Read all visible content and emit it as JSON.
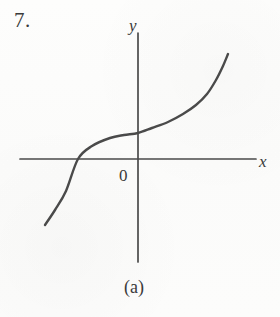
{
  "figure": {
    "problem_number": "7.",
    "caption": "(a)",
    "origin_label": "0",
    "x_axis_label": "x",
    "y_axis_label": "y",
    "background_color": "#fcfcfb",
    "ink_color": "#4a4a4a",
    "text_color": "#3a3a3a"
  },
  "chart_data": {
    "type": "line",
    "title": "",
    "subtitle": "",
    "xlabel": "x",
    "ylabel": "y",
    "legend": [],
    "grid": false,
    "annotations": [
      "0"
    ],
    "axes": {
      "origin_px": [
        138,
        159
      ],
      "x_axis_px": {
        "x_start": 20,
        "x_end": 256,
        "y": 159
      },
      "y_axis_px": {
        "y_start": 33,
        "y_end": 262,
        "x": 138
      },
      "x_arrow": false,
      "y_arrow": false
    },
    "series": [
      {
        "name": "curve",
        "points_px": [
          [
            45,
            225
          ],
          [
            55,
            210
          ],
          [
            66,
            191
          ],
          [
            78,
            159
          ],
          [
            92,
            146
          ],
          [
            110,
            138
          ],
          [
            124,
            135
          ],
          [
            138,
            133
          ],
          [
            152,
            128
          ],
          [
            168,
            122
          ],
          [
            183,
            114
          ],
          [
            196,
            105
          ],
          [
            207,
            94
          ],
          [
            216,
            80
          ],
          [
            223,
            66
          ],
          [
            228,
            54
          ]
        ],
        "x_intercept_px": [
          78,
          159
        ],
        "y_intercept_px": [
          138,
          133
        ],
        "inflection_px": [
          124,
          135
        ],
        "stroke_width": 2.4
      }
    ]
  }
}
